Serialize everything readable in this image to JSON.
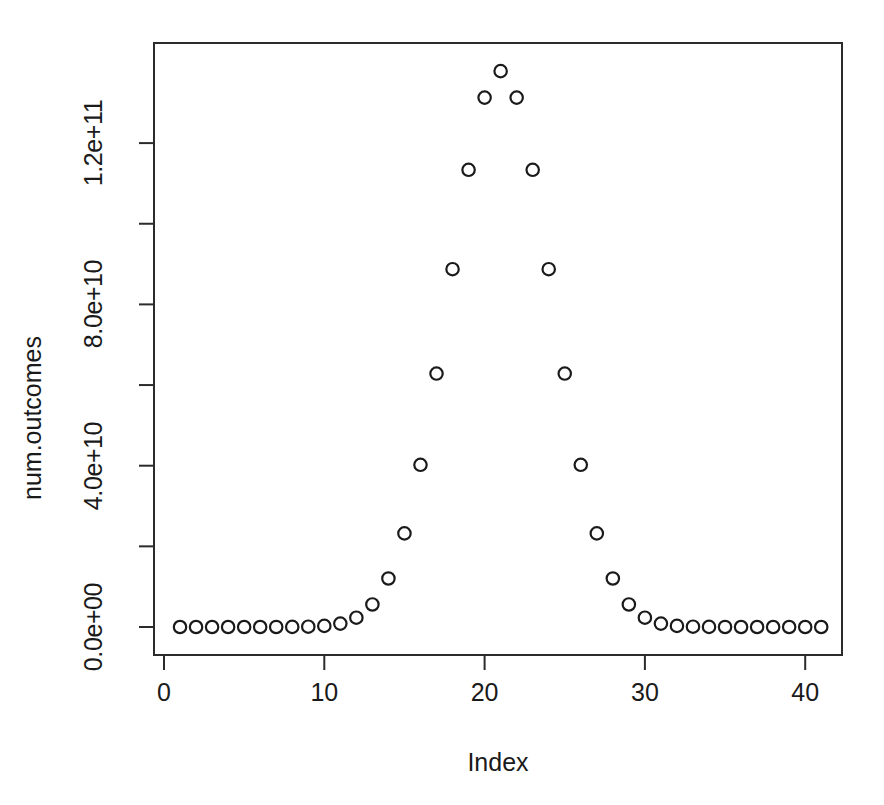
{
  "chart_data": {
    "type": "scatter",
    "title": "",
    "xlabel": "Index",
    "ylabel": "num.outcomes",
    "xlim": [
      0.4,
      42.4
    ],
    "ylim": [
      -5500000000.0,
      143000000000.0
    ],
    "grid": false,
    "legend": "none",
    "point_symbol": "open-circle",
    "point_color": "#1a1a1a",
    "xticks": [
      0,
      10,
      20,
      30,
      40
    ],
    "xtick_labels": [
      "0",
      "10",
      "20",
      "30",
      "40"
    ],
    "yticks": [
      0,
      20000000000,
      40000000000,
      60000000000,
      80000000000,
      100000000000,
      120000000000
    ],
    "ytick_labels": [
      "0.0e+00",
      "",
      "4.0e+10",
      "",
      "8.0e+10",
      "",
      "1.2e+11"
    ],
    "ytick_labeled": [
      true,
      false,
      true,
      false,
      true,
      false,
      true
    ],
    "x": [
      1,
      2,
      3,
      4,
      5,
      6,
      7,
      8,
      9,
      10,
      11,
      12,
      13,
      14,
      15,
      16,
      17,
      18,
      19,
      20,
      21,
      22,
      23,
      24,
      25,
      26,
      27,
      28,
      29,
      30,
      31,
      32,
      33,
      34,
      35,
      36,
      37,
      38,
      39,
      40,
      41
    ],
    "y": [
      1,
      40,
      780,
      9880,
      91390,
      658008,
      3838380,
      18643560,
      76904685,
      273438880,
      847660528,
      2311801440,
      5586853480,
      12033222880,
      23206929840,
      40225345056,
      62852101650,
      88732378800,
      113380261800,
      131282408400,
      137846528820,
      131282408400,
      113380261800,
      88732378800,
      62852101650,
      40225345056,
      23206929840,
      12033222880,
      5586853480,
      2311801440,
      847660528,
      273438880,
      76904685,
      18643560,
      3838380,
      658008,
      91390,
      9880,
      780,
      40,
      1
    ]
  },
  "axes": {
    "x_title": "Index",
    "y_title": "num.outcomes"
  },
  "geometry": {
    "panel": {
      "left": 153,
      "top": 42,
      "width": 690,
      "height": 614
    },
    "x_origin_px": 164,
    "x_unit_px": 16.03,
    "y_zero_px": 627,
    "y_unit_px_per_4e10": 161.3
  }
}
